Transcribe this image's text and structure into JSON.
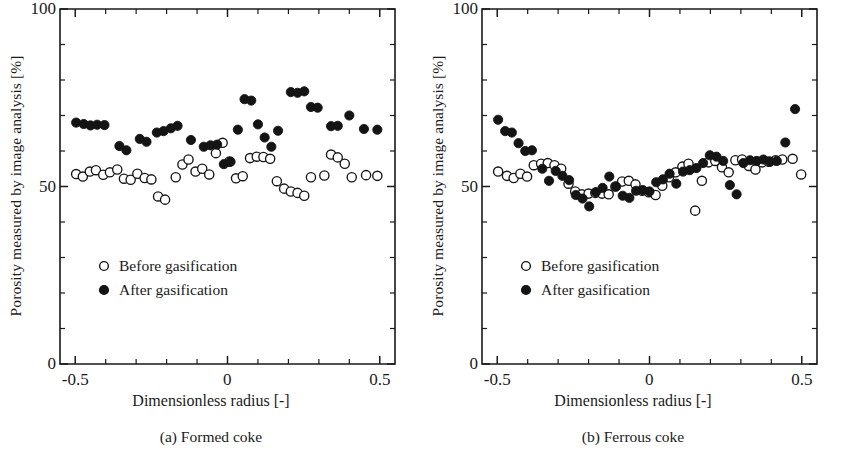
{
  "figure": {
    "panels": [
      {
        "id": "a",
        "caption": "(a) Formed coke",
        "xlabel": "Dimensionless radius [-]",
        "ylabel": "Porosity measured by image analysis [%]",
        "legend": [
          {
            "marker": "open-circle",
            "label": "Before gasification"
          },
          {
            "marker": "filled-circle",
            "label": "After gasification"
          }
        ],
        "xticks": [
          "-0.5",
          "0",
          "0.5"
        ],
        "yticks": [
          "0",
          "50",
          "100"
        ]
      },
      {
        "id": "b",
        "caption": "(b) Ferrous coke",
        "xlabel": "Dimensionless radius [-]",
        "ylabel": "Porosity measured by image analysis [%]",
        "legend": [
          {
            "marker": "open-circle",
            "label": "Before gasification"
          },
          {
            "marker": "filled-circle",
            "label": "After gasification"
          }
        ],
        "xticks": [
          "-0.5",
          "0",
          "0.5"
        ],
        "yticks": [
          "0",
          "50",
          "100"
        ]
      }
    ]
  },
  "chart_data": [
    {
      "type": "scatter",
      "title": "(a) Formed coke",
      "xlabel": "Dimensionless radius [-]",
      "ylabel": "Porosity measured by image analysis [%]",
      "xlim": [
        -0.55,
        0.55
      ],
      "ylim": [
        0,
        100
      ],
      "xticks": [
        -0.5,
        0.0,
        0.5
      ],
      "yticks": [
        0,
        50,
        100
      ],
      "xminor_step": 0.1,
      "yminor_step": 10,
      "grid": false,
      "legend_position": "inside-lower-left",
      "series": [
        {
          "name": "Before gasification",
          "marker": "open-circle",
          "color": "#ffffff",
          "edge_color": "#141414",
          "points": [
            [
              -0.497,
              53.5
            ],
            [
              -0.475,
              52.8
            ],
            [
              -0.452,
              54.2
            ],
            [
              -0.432,
              54.6
            ],
            [
              -0.408,
              53.3
            ],
            [
              -0.386,
              54.0
            ],
            [
              -0.362,
              54.8
            ],
            [
              -0.34,
              52.2
            ],
            [
              -0.318,
              51.9
            ],
            [
              -0.296,
              53.6
            ],
            [
              -0.272,
              52.4
            ],
            [
              -0.25,
              52.0
            ],
            [
              -0.228,
              47.2
            ],
            [
              -0.205,
              46.3
            ],
            [
              -0.17,
              52.6
            ],
            [
              -0.148,
              56.2
            ],
            [
              -0.128,
              57.6
            ],
            [
              -0.105,
              54.2
            ],
            [
              -0.083,
              55.0
            ],
            [
              -0.06,
              53.4
            ],
            [
              -0.038,
              59.4
            ],
            [
              -0.016,
              62.3
            ],
            [
              0.006,
              57.0
            ],
            [
              0.028,
              52.3
            ],
            [
              0.05,
              52.9
            ],
            [
              0.074,
              58.0
            ],
            [
              0.096,
              58.4
            ],
            [
              0.118,
              58.3
            ],
            [
              0.14,
              57.8
            ],
            [
              0.162,
              51.5
            ],
            [
              0.186,
              49.4
            ],
            [
              0.208,
              48.6
            ],
            [
              0.23,
              48.2
            ],
            [
              0.252,
              47.4
            ],
            [
              0.274,
              52.6
            ],
            [
              0.318,
              53.1
            ],
            [
              0.34,
              59.0
            ],
            [
              0.362,
              58.2
            ],
            [
              0.385,
              56.4
            ],
            [
              0.408,
              52.6
            ],
            [
              0.455,
              53.2
            ],
            [
              0.492,
              53.0
            ]
          ]
        },
        {
          "name": "After gasification",
          "marker": "filled-circle",
          "color": "#141414",
          "points": [
            [
              -0.497,
              68.0
            ],
            [
              -0.472,
              67.6
            ],
            [
              -0.45,
              67.2
            ],
            [
              -0.428,
              67.4
            ],
            [
              -0.404,
              67.3
            ],
            [
              -0.355,
              61.4
            ],
            [
              -0.332,
              60.2
            ],
            [
              -0.288,
              63.4
            ],
            [
              -0.266,
              62.6
            ],
            [
              -0.232,
              65.2
            ],
            [
              -0.21,
              65.6
            ],
            [
              -0.186,
              66.4
            ],
            [
              -0.164,
              67.1
            ],
            [
              -0.12,
              63.1
            ],
            [
              -0.078,
              61.2
            ],
            [
              -0.056,
              61.6
            ],
            [
              -0.034,
              61.8
            ],
            [
              -0.012,
              56.3
            ],
            [
              0.01,
              57.0
            ],
            [
              0.034,
              66.0
            ],
            [
              0.056,
              74.6
            ],
            [
              0.078,
              74.2
            ],
            [
              0.1,
              67.5
            ],
            [
              0.122,
              63.8
            ],
            [
              0.144,
              61.2
            ],
            [
              0.166,
              65.7
            ],
            [
              0.208,
              76.6
            ],
            [
              0.23,
              76.4
            ],
            [
              0.252,
              76.8
            ],
            [
              0.274,
              72.4
            ],
            [
              0.296,
              72.2
            ],
            [
              0.34,
              67.0
            ],
            [
              0.362,
              67.1
            ],
            [
              0.4,
              70.0
            ],
            [
              0.448,
              66.2
            ],
            [
              0.492,
              66.0
            ]
          ]
        }
      ]
    },
    {
      "type": "scatter",
      "title": "(b) Ferrous coke",
      "xlabel": "Dimensionless radius [-]",
      "ylabel": "Porosity measured by image analysis [%]",
      "xlim": [
        -0.55,
        0.55
      ],
      "ylim": [
        0,
        100
      ],
      "xticks": [
        -0.5,
        0.0,
        0.5
      ],
      "yticks": [
        0,
        50,
        100
      ],
      "xminor_step": 0.1,
      "yminor_step": 10,
      "grid": false,
      "legend_position": "inside-lower-left",
      "series": [
        {
          "name": "Before gasification",
          "marker": "open-circle",
          "color": "#ffffff",
          "edge_color": "#141414",
          "points": [
            [
              -0.497,
              54.2
            ],
            [
              -0.468,
              53.0
            ],
            [
              -0.446,
              52.4
            ],
            [
              -0.424,
              53.6
            ],
            [
              -0.402,
              52.8
            ],
            [
              -0.38,
              56.0
            ],
            [
              -0.356,
              56.4
            ],
            [
              -0.334,
              56.6
            ],
            [
              -0.312,
              56.0
            ],
            [
              -0.29,
              55.0
            ],
            [
              -0.266,
              50.8
            ],
            [
              -0.244,
              48.6
            ],
            [
              -0.222,
              47.8
            ],
            [
              -0.2,
              48.0
            ],
            [
              -0.178,
              48.2
            ],
            [
              -0.156,
              48.0
            ],
            [
              -0.134,
              47.8
            ],
            [
              -0.112,
              50.0
            ],
            [
              -0.09,
              51.4
            ],
            [
              -0.068,
              51.6
            ],
            [
              -0.046,
              50.6
            ],
            [
              -0.024,
              48.8
            ],
            [
              -0.002,
              48.4
            ],
            [
              0.02,
              47.6
            ],
            [
              0.042,
              50.2
            ],
            [
              0.064,
              52.6
            ],
            [
              0.086,
              54.0
            ],
            [
              0.108,
              55.6
            ],
            [
              0.128,
              56.4
            ],
            [
              0.15,
              43.2
            ],
            [
              0.172,
              51.6
            ],
            [
              0.194,
              56.8
            ],
            [
              0.216,
              57.2
            ],
            [
              0.238,
              55.4
            ],
            [
              0.26,
              54.0
            ],
            [
              0.282,
              57.4
            ],
            [
              0.304,
              57.6
            ],
            [
              0.326,
              55.8
            ],
            [
              0.348,
              54.8
            ],
            [
              0.37,
              56.8
            ],
            [
              0.392,
              57.0
            ],
            [
              0.414,
              57.4
            ],
            [
              0.436,
              57.6
            ],
            [
              0.47,
              57.8
            ],
            [
              0.498,
              53.4
            ]
          ]
        },
        {
          "name": "After gasification",
          "marker": "filled-circle",
          "color": "#141414",
          "points": [
            [
              -0.497,
              68.8
            ],
            [
              -0.474,
              65.6
            ],
            [
              -0.452,
              65.2
            ],
            [
              -0.43,
              62.2
            ],
            [
              -0.408,
              60.0
            ],
            [
              -0.386,
              60.2
            ],
            [
              -0.352,
              55.0
            ],
            [
              -0.33,
              51.6
            ],
            [
              -0.308,
              54.4
            ],
            [
              -0.286,
              53.0
            ],
            [
              -0.264,
              51.8
            ],
            [
              -0.242,
              47.6
            ],
            [
              -0.22,
              46.6
            ],
            [
              -0.198,
              44.4
            ],
            [
              -0.176,
              48.4
            ],
            [
              -0.154,
              49.6
            ],
            [
              -0.132,
              52.8
            ],
            [
              -0.11,
              50.0
            ],
            [
              -0.088,
              47.4
            ],
            [
              -0.066,
              46.8
            ],
            [
              -0.044,
              48.8
            ],
            [
              -0.022,
              49.0
            ],
            [
              0.0,
              48.6
            ],
            [
              0.022,
              51.2
            ],
            [
              0.044,
              52.0
            ],
            [
              0.066,
              53.6
            ],
            [
              0.088,
              50.8
            ],
            [
              0.11,
              54.2
            ],
            [
              0.132,
              54.6
            ],
            [
              0.154,
              55.2
            ],
            [
              0.176,
              56.6
            ],
            [
              0.198,
              58.8
            ],
            [
              0.22,
              58.4
            ],
            [
              0.242,
              57.2
            ],
            [
              0.264,
              50.4
            ],
            [
              0.286,
              47.8
            ],
            [
              0.308,
              56.6
            ],
            [
              0.33,
              57.4
            ],
            [
              0.352,
              57.2
            ],
            [
              0.374,
              57.6
            ],
            [
              0.396,
              57.0
            ],
            [
              0.418,
              57.2
            ],
            [
              0.446,
              62.4
            ],
            [
              0.478,
              71.8
            ]
          ]
        }
      ]
    }
  ]
}
